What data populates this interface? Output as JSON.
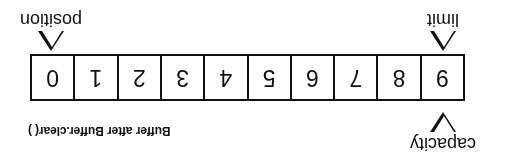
{
  "figure": {
    "caption": "Buffer after Buffer.clear( )",
    "orientation": "rotated-180",
    "colors": {
      "ink": "#111111",
      "background": "#ffffff"
    },
    "buffer": {
      "cells": [
        {
          "index": "0"
        },
        {
          "index": "1"
        },
        {
          "index": "2"
        },
        {
          "index": "3"
        },
        {
          "index": "4"
        },
        {
          "index": "5"
        },
        {
          "index": "6"
        },
        {
          "index": "7"
        },
        {
          "index": "8"
        },
        {
          "index": "9"
        }
      ]
    },
    "markers": {
      "capacity": {
        "label": "capacity",
        "icon": "triangle-down-icon",
        "points_to_cell": "9"
      },
      "limit": {
        "label": "limit",
        "icon": "triangle-up-icon",
        "points_to_cell": "9"
      },
      "position": {
        "label": "position",
        "icon": "triangle-up-icon",
        "points_to_cell": "0"
      }
    }
  }
}
